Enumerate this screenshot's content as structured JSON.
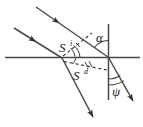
{
  "figure": {
    "colors": {
      "line": "#4a4a4a",
      "line_dark": "#2e2e2e",
      "dashed": "#3a3a3a",
      "text": "#1a1a1a",
      "background": "#ffffff"
    },
    "labels": {
      "s_incident_base": "S",
      "s_incident_sup": "i",
      "s_diffracted_base": "S",
      "s_diffracted_sup": "d",
      "angle_alpha": "α",
      "angle_psi": "ψ"
    },
    "elements": {
      "horizontal_line_name": "surface-line",
      "vertical_line_name": "normal-line",
      "incident_ray_1_name": "incident-ray-upper",
      "incident_ray_2_name": "incident-ray-lower",
      "scattered_ray_1_name": "scattered-ray-left",
      "scattered_ray_2_name": "scattered-ray-right",
      "dashed_si_name": "dashed-vector-si",
      "dashed_sd_name": "dashed-vector-sd"
    }
  }
}
